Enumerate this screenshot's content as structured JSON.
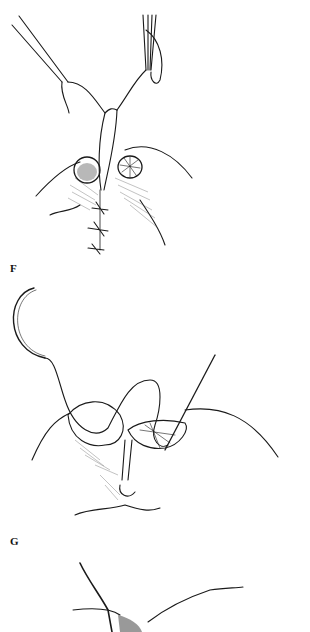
{
  "page": {
    "background": "#ffffff",
    "ink_color": "#1a1a1a"
  },
  "figures": [
    {
      "label": "F",
      "description": "Forceps holding suture loop above two stomas; sutures placed between them"
    },
    {
      "label": "G",
      "description": "Curved needle with suture passing through stoma edges; straight instrument inserted"
    },
    {
      "label": "",
      "description": "Partial illustration of next step (cropped)"
    }
  ]
}
